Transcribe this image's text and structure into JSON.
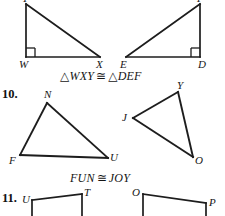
{
  "page": {
    "background_color": "#ffffff",
    "ink_color": "#1a1a1a"
  },
  "problems": [
    {
      "number": "",
      "number_label": "",
      "congruence_statement": {
        "left_triangle_symbol": "△",
        "left_vertices": "WXY",
        "relation": "≅",
        "right_triangle_symbol": "△",
        "right_vertices": "DEF",
        "full_text": "△WXY ≅ △DEF"
      },
      "figures": [
        {
          "name": "triangle-wxy",
          "vertex_labels": [
            "Y",
            "W",
            "X"
          ],
          "right_angle_at": "W"
        },
        {
          "name": "triangle-def",
          "vertex_labels": [
            "F",
            "E",
            "D"
          ],
          "right_angle_at": "D"
        }
      ]
    },
    {
      "number": "10",
      "number_label": "10.",
      "congruence_statement": {
        "left_triangle_symbol": "",
        "left_vertices": "FUN",
        "relation": "≅",
        "right_triangle_symbol": "",
        "right_vertices": "JOY",
        "full_text": "FUN ≅ JOY"
      },
      "figures": [
        {
          "name": "triangle-fun",
          "vertex_labels": [
            "N",
            "F",
            "U"
          ],
          "right_angle_at": ""
        },
        {
          "name": "triangle-joy",
          "vertex_labels": [
            "Y",
            "J",
            "O"
          ],
          "right_angle_at": ""
        }
      ]
    },
    {
      "number": "11",
      "number_label": "11.",
      "congruence_statement": {
        "full_text": ""
      },
      "figures": [
        {
          "name": "quadrilateral-left",
          "vertex_labels": [
            "U",
            "T"
          ],
          "right_angle_at": ""
        },
        {
          "name": "quadrilateral-right",
          "vertex_labels": [
            "O",
            "P"
          ],
          "right_angle_at": ""
        }
      ]
    }
  ],
  "labels": {
    "y_top_left": "Y",
    "w": "W",
    "x": "X",
    "f_top_right": "F",
    "e": "E",
    "d": "D",
    "n": "N",
    "f_left": "F",
    "u": "U",
    "y_right": "Y",
    "j": "J",
    "o": "O",
    "u2": "U",
    "t2": "T",
    "o2": "O",
    "p2": "P"
  },
  "text": {
    "q10_number": "10.",
    "q11_number": "11.",
    "congruence_1": "△WXY ≅ △DEF",
    "congruence_2": "FUN ≅ JOY",
    "triangle_symbol": "△",
    "congruent_symbol": "≅",
    "wxy": "WXY",
    "def": "DEF",
    "fun": "FUN",
    "joy": "JOY"
  }
}
